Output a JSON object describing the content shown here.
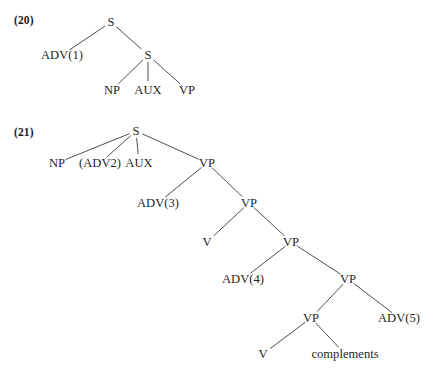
{
  "document": {
    "background_color": "#ffffff",
    "text_color": "#1f1f1f",
    "line_color": "#3a3a3a"
  },
  "examples": [
    {
      "number_label": "(20)",
      "number_x": 14,
      "number_y": 14,
      "nodes": [
        {
          "id": "s-root",
          "label": "S",
          "x": 111,
          "y": 22
        },
        {
          "id": "adv1",
          "label": "ADV(1)",
          "x": 62,
          "y": 55
        },
        {
          "id": "s-embed",
          "label": "S",
          "x": 148,
          "y": 55
        },
        {
          "id": "np",
          "label": "NP",
          "x": 112,
          "y": 90
        },
        {
          "id": "aux",
          "label": "AUX",
          "x": 148,
          "y": 90
        },
        {
          "id": "vp",
          "label": "VP",
          "x": 187,
          "y": 90
        }
      ],
      "edges": [
        {
          "from": "s-root",
          "to": "adv1"
        },
        {
          "from": "s-root",
          "to": "s-embed"
        },
        {
          "from": "s-embed",
          "to": "np"
        },
        {
          "from": "s-embed",
          "to": "aux"
        },
        {
          "from": "s-embed",
          "to": "vp"
        }
      ]
    },
    {
      "number_label": "(21)",
      "number_x": 14,
      "number_y": 126,
      "nodes": [
        {
          "id": "s-root",
          "label": "S",
          "x": 136,
          "y": 131
        },
        {
          "id": "np",
          "label": "NP",
          "x": 57,
          "y": 163
        },
        {
          "id": "adv2",
          "label": "(ADV2)",
          "x": 100,
          "y": 163
        },
        {
          "id": "aux",
          "label": "AUX",
          "x": 139,
          "y": 163
        },
        {
          "id": "vp1",
          "label": "VP",
          "x": 207,
          "y": 163
        },
        {
          "id": "adv3",
          "label": "ADV(3)",
          "x": 158,
          "y": 203
        },
        {
          "id": "vp2",
          "label": "VP",
          "x": 249,
          "y": 203
        },
        {
          "id": "v1",
          "label": "V",
          "x": 207,
          "y": 242
        },
        {
          "id": "vp3",
          "label": "VP",
          "x": 291,
          "y": 242
        },
        {
          "id": "adv4",
          "label": "ADV(4)",
          "x": 243,
          "y": 279
        },
        {
          "id": "vp4",
          "label": "VP",
          "x": 348,
          "y": 279
        },
        {
          "id": "vp5",
          "label": "VP",
          "x": 311,
          "y": 318
        },
        {
          "id": "adv5",
          "label": "ADV(5)",
          "x": 399,
          "y": 318
        },
        {
          "id": "v2",
          "label": "V",
          "x": 263,
          "y": 354
        },
        {
          "id": "comps",
          "label": "complements",
          "x": 345,
          "y": 354
        }
      ],
      "edges": [
        {
          "from": "s-root",
          "to": "np"
        },
        {
          "from": "s-root",
          "to": "adv2"
        },
        {
          "from": "s-root",
          "to": "aux"
        },
        {
          "from": "s-root",
          "to": "vp1"
        },
        {
          "from": "vp1",
          "to": "adv3"
        },
        {
          "from": "vp1",
          "to": "vp2"
        },
        {
          "from": "vp2",
          "to": "v1"
        },
        {
          "from": "vp2",
          "to": "vp3"
        },
        {
          "from": "vp3",
          "to": "adv4"
        },
        {
          "from": "vp3",
          "to": "vp4"
        },
        {
          "from": "vp4",
          "to": "vp5"
        },
        {
          "from": "vp4",
          "to": "adv5"
        },
        {
          "from": "vp5",
          "to": "v2"
        },
        {
          "from": "vp5",
          "to": "comps"
        }
      ]
    }
  ]
}
